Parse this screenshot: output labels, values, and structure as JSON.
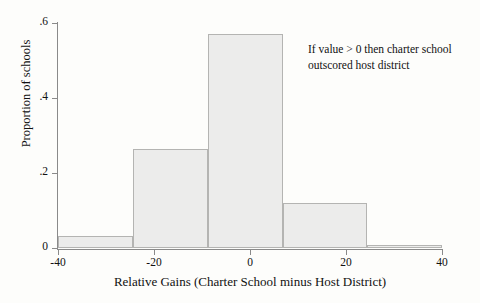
{
  "chart_data": {
    "type": "bar",
    "chart_subtype": "histogram",
    "title": "",
    "subtitle": "",
    "xlabel": "Relative Gains (Charter School minus Host District)",
    "ylabel": "Proportion of schools",
    "xlim": [
      -40,
      40
    ],
    "ylim": [
      0,
      0.6
    ],
    "grid": false,
    "legend": null,
    "legend_position": "none",
    "xticks": [
      -40,
      -20,
      0,
      20,
      40
    ],
    "xtick_labels": [
      "-40",
      "-20",
      "0",
      "20",
      "40"
    ],
    "yticks": [
      0,
      0.2,
      0.4,
      0.6
    ],
    "ytick_labels": [
      "0",
      ".2",
      ".4",
      ".6"
    ],
    "bin_edges": [
      -40,
      -24.4,
      -8.8,
      6.8,
      24.4,
      40
    ],
    "categories": [
      "-40 to -24.4",
      "-24.4 to -8.8",
      "-8.8 to 6.8",
      "6.8 to 24.4",
      "24.4 to 40"
    ],
    "values": [
      0.032,
      0.265,
      0.572,
      0.12,
      0.008
    ],
    "bars": [
      {
        "label": "-40 to -24.4",
        "x_start": -40,
        "x_end": -24.4,
        "value": 0.032
      },
      {
        "label": "-24.4 to -8.8",
        "x_start": -24.4,
        "x_end": -8.8,
        "value": 0.265
      },
      {
        "label": "-8.8 to 6.8",
        "x_start": -8.8,
        "x_end": 6.8,
        "value": 0.572
      },
      {
        "label": "6.8 to 24.4",
        "x_start": 6.8,
        "x_end": 24.4,
        "value": 0.12
      },
      {
        "label": "24.4 to 40",
        "x_start": 24.4,
        "x_end": 40,
        "value": 0.008
      }
    ],
    "annotations": [
      {
        "text": "If value > 0 then charter school outscored host district",
        "lines": [
          "If value > 0 then charter school",
          "outscored host district"
        ],
        "x": 12,
        "y": 0.55
      }
    ],
    "colors": {
      "bar_fill": "#ececeb",
      "bar_edge": "#b4b4b2",
      "axis": "#8a8a8a",
      "text": "#111111",
      "background": "#fdfdfb"
    }
  }
}
